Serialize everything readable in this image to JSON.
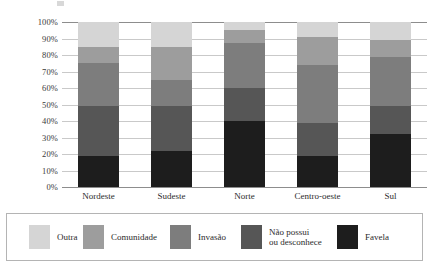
{
  "chart_data": {
    "type": "bar",
    "title": "",
    "subtitle": "",
    "xlabel": "",
    "ylabel": "",
    "stacked": true,
    "stack_total": 100,
    "grid": true,
    "legend_position": "bottom",
    "ylim": [
      0,
      100
    ],
    "ytick_labels": [
      "100%",
      "90%",
      "80%",
      "70%",
      "60%",
      "50%",
      "40%",
      "30%",
      "20%",
      "10%",
      "0%"
    ],
    "ytick_values": [
      100,
      90,
      80,
      70,
      60,
      50,
      40,
      30,
      20,
      10,
      0
    ],
    "categories": [
      "Nordeste",
      "Sudeste",
      "Norte",
      "Centro-oeste",
      "Sul"
    ],
    "series": [
      {
        "name": "Favela",
        "color": "#1d1d1d",
        "values": [
          19,
          22,
          40,
          19,
          32
        ]
      },
      {
        "name": "Não possui ou desconhece",
        "color": "#565656",
        "values": [
          30,
          27,
          20,
          20,
          17
        ]
      },
      {
        "name": "Invasão",
        "color": "#7d7d7d",
        "values": [
          26,
          16,
          27,
          35,
          30
        ]
      },
      {
        "name": "Comunidade",
        "color": "#9d9d9d",
        "values": [
          10,
          20,
          8,
          17,
          10
        ]
      },
      {
        "name": "Outra",
        "color": "#d5d5d5",
        "values": [
          15,
          15,
          5,
          9,
          11
        ]
      }
    ]
  },
  "legend": {
    "items": [
      {
        "label": "Outra",
        "color": "#d5d5d5"
      },
      {
        "label": "Comunidade",
        "color": "#9d9d9d"
      },
      {
        "label": "Invasão",
        "color": "#7d7d7d"
      },
      {
        "label": "Não possui\nou desconhece",
        "color": "#565656"
      },
      {
        "label": "Favela",
        "color": "#1d1d1d"
      }
    ]
  },
  "colors": {
    "gridline": "#c9c9c9",
    "axis": "#8d8d8d",
    "legend_border": "#b4b4b4",
    "text": "#2b2b2b",
    "background": "#ffffff"
  }
}
